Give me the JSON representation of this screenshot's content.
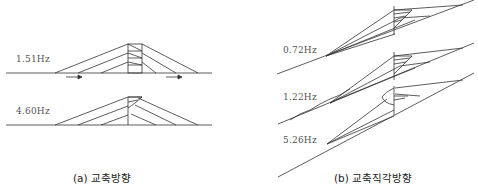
{
  "panels": [
    {
      "caption": "(a) 교축방향",
      "modes": [
        {
          "frequency": "1.51Hz"
        },
        {
          "frequency": "4.60Hz"
        }
      ]
    },
    {
      "caption": "(b) 교축직각방향",
      "modes": [
        {
          "frequency": "0.72Hz"
        },
        {
          "frequency": "1.22Hz"
        },
        {
          "frequency": "5.26Hz"
        }
      ]
    }
  ],
  "colors": {
    "line": "#333333",
    "text": "#555555"
  }
}
